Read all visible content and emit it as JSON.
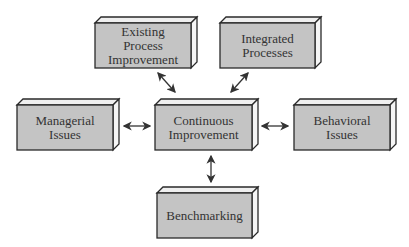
{
  "diagram": {
    "type": "hub-and-spoke",
    "center": {
      "id": "continuous-improvement",
      "label_lines": [
        "Continuous",
        "Improvement"
      ]
    },
    "nodes": [
      {
        "id": "existing-process-improvement",
        "label_lines": [
          "Existing",
          "Process",
          "Improvement"
        ]
      },
      {
        "id": "integrated-processes",
        "label_lines": [
          "Integrated",
          "Processes"
        ]
      },
      {
        "id": "managerial-issues",
        "label_lines": [
          "Managerial",
          "Issues"
        ]
      },
      {
        "id": "behavioral-issues",
        "label_lines": [
          "Behavioral",
          "Issues"
        ]
      },
      {
        "id": "benchmarking",
        "label_lines": [
          "Benchmarking"
        ]
      }
    ],
    "edges": [
      {
        "from": "existing-process-improvement",
        "to": "continuous-improvement",
        "bidirectional": true
      },
      {
        "from": "integrated-processes",
        "to": "continuous-improvement",
        "bidirectional": true
      },
      {
        "from": "managerial-issues",
        "to": "continuous-improvement",
        "bidirectional": true
      },
      {
        "from": "behavioral-issues",
        "to": "continuous-improvement",
        "bidirectional": true
      },
      {
        "from": "benchmarking",
        "to": "continuous-improvement",
        "bidirectional": true
      }
    ],
    "colors": {
      "box_face": "#c4c4c4",
      "box_edge": "#2a2a2a",
      "text": "#333333",
      "arrow": "#333333"
    }
  },
  "labels": {
    "epi_1": "Existing",
    "epi_2": "Process",
    "epi_3": "Improvement",
    "ip_1": "Integrated",
    "ip_2": "Processes",
    "mi_1": "Managerial",
    "mi_2": "Issues",
    "ci_1": "Continuous",
    "ci_2": "Improvement",
    "bi_1": "Behavioral",
    "bi_2": "Issues",
    "bm_1": "Benchmarking"
  }
}
